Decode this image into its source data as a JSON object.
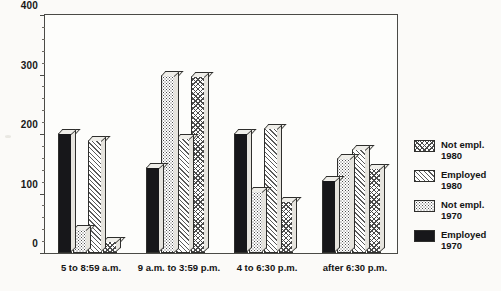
{
  "chart_data": {
    "type": "bar",
    "title": "",
    "xlabel": "",
    "ylabel": "",
    "ylim": [
      0,
      400
    ],
    "yticks": [
      0,
      100,
      200,
      300,
      400
    ],
    "ytick_labels": [
      "0",
      "100",
      "200",
      "300",
      "400"
    ],
    "grid": false,
    "legend_position": "right",
    "categories": [
      "5 to 8:59 a.m.",
      "9 a.m. to 3:59 p.m.",
      "4 to 6:30 p.m.",
      "after 6:30 p.m."
    ],
    "series": [
      {
        "name": "Employed 1970",
        "pattern": "solid",
        "values": [
          202,
          145,
          202,
          122
        ]
      },
      {
        "name": "Not empl. 1970",
        "pattern": "dots",
        "values": [
          40,
          300,
          105,
          160
        ]
      },
      {
        "name": "Employed 1980",
        "pattern": "diag",
        "values": [
          190,
          193,
          210,
          175
        ]
      },
      {
        "name": "Not empl. 1980",
        "pattern": "cross",
        "values": [
          20,
          297,
          88,
          143
        ]
      }
    ]
  },
  "legend": {
    "entries": [
      {
        "line1": "Not empl.",
        "line2": "1980",
        "pattern": "cross"
      },
      {
        "line1": "Employed",
        "line2": "1980",
        "pattern": "diag"
      },
      {
        "line1": "Not empl.",
        "line2": "1970",
        "pattern": "dots"
      },
      {
        "line1": "Employed",
        "line2": "1970",
        "pattern": "solid"
      }
    ]
  },
  "colors": {
    "axis": "#4a4a46",
    "solid_fill": "#17171a",
    "background": "#fbfaf8"
  }
}
